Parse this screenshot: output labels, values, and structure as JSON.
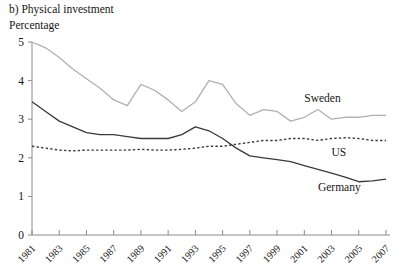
{
  "figure": {
    "title": "b) Physical investment",
    "subtitle": "Percentage"
  },
  "chart_data": {
    "type": "line",
    "title": "b) Physical investment",
    "subtitle": "Percentage",
    "xlabel": "",
    "ylabel": "Percentage",
    "xlim": [
      1981,
      2007
    ],
    "ylim": [
      0,
      5
    ],
    "yticks": [
      0,
      1,
      2,
      3,
      4,
      5
    ],
    "ytick_labels": [
      "0",
      "1",
      "2",
      "3",
      "4",
      "5"
    ],
    "xticks": [
      1981,
      1983,
      1985,
      1987,
      1989,
      1991,
      1993,
      1995,
      1997,
      1999,
      2001,
      2003,
      2005,
      2007
    ],
    "xtick_labels": [
      "1981",
      "1983",
      "1985",
      "1987",
      "1989",
      "1991",
      "1993",
      "1995",
      "1997",
      "1999",
      "2001",
      "2003",
      "2005",
      "2007"
    ],
    "grid": false,
    "legend_position": "inline-right",
    "x": [
      1981,
      1982,
      1983,
      1984,
      1985,
      1986,
      1987,
      1988,
      1989,
      1990,
      1991,
      1992,
      1993,
      1994,
      1995,
      1996,
      1997,
      1998,
      1999,
      2000,
      2001,
      2002,
      2003,
      2004,
      2005,
      2006,
      2007
    ],
    "series": [
      {
        "name": "Sweden",
        "color": "#b0b0b0",
        "style": "solid",
        "label": "Sweden",
        "values": [
          5.0,
          4.85,
          4.6,
          4.3,
          4.05,
          3.8,
          3.5,
          3.35,
          3.9,
          3.75,
          3.5,
          3.2,
          3.45,
          4.0,
          3.9,
          3.4,
          3.1,
          3.25,
          3.2,
          2.95,
          3.05,
          3.25,
          3.0,
          3.05,
          3.05,
          3.1,
          3.1
        ]
      },
      {
        "name": "US",
        "color": "#3a3a3a",
        "style": "dashed",
        "label": "US",
        "values": [
          2.3,
          2.25,
          2.2,
          2.18,
          2.2,
          2.2,
          2.2,
          2.2,
          2.22,
          2.2,
          2.2,
          2.22,
          2.25,
          2.3,
          2.3,
          2.35,
          2.4,
          2.45,
          2.45,
          2.5,
          2.5,
          2.45,
          2.5,
          2.52,
          2.5,
          2.45,
          2.45
        ]
      },
      {
        "name": "Germany",
        "color": "#3a3a3a",
        "style": "solid",
        "label": "Germany",
        "values": [
          3.45,
          3.2,
          2.95,
          2.8,
          2.65,
          2.6,
          2.6,
          2.55,
          2.5,
          2.5,
          2.5,
          2.6,
          2.8,
          2.7,
          2.5,
          2.25,
          2.05,
          2.0,
          1.95,
          1.9,
          1.8,
          1.7,
          1.6,
          1.5,
          1.38,
          1.4,
          1.45
        ]
      }
    ],
    "annotations": [
      {
        "text": "Sweden",
        "x": 2001,
        "y": 3.45
      },
      {
        "text": "US",
        "x": 2003,
        "y": 2.05
      },
      {
        "text": "Germany",
        "x": 2002,
        "y": 1.15
      }
    ]
  }
}
